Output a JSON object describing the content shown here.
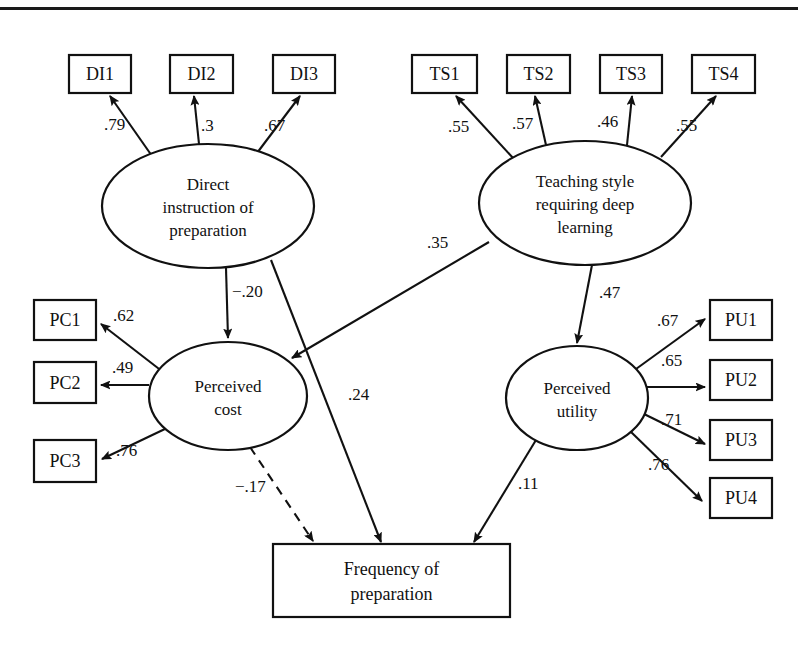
{
  "figure": {
    "type": "sem-path-diagram",
    "top_rule": true
  },
  "latent_variables": [
    {
      "id": "DI",
      "label_lines": [
        "Direct",
        "instruction of",
        "preparation"
      ],
      "cx": 208,
      "cy": 206,
      "rx": 106,
      "ry": 62
    },
    {
      "id": "TS",
      "label_lines": [
        "Teaching style",
        "requiring deep",
        "learning"
      ],
      "cx": 585,
      "cy": 203,
      "rx": 106,
      "ry": 62
    },
    {
      "id": "PC",
      "label_lines": [
        "Perceived",
        "cost"
      ],
      "cx": 228,
      "cy": 396,
      "rx": 79,
      "ry": 54
    },
    {
      "id": "PU",
      "label_lines": [
        "Perceived",
        "utility"
      ],
      "cx": 577,
      "cy": 398,
      "rx": 71,
      "ry": 52
    }
  ],
  "observed_variables": [
    {
      "id": "DI1",
      "label": "DI1",
      "x": 69,
      "y": 55,
      "w": 62,
      "h": 38
    },
    {
      "id": "DI2",
      "label": "DI2",
      "x": 170,
      "y": 55,
      "w": 63,
      "h": 38
    },
    {
      "id": "DI3",
      "label": "DI3",
      "x": 273,
      "y": 55,
      "w": 62,
      "h": 38
    },
    {
      "id": "TS1",
      "label": "TS1",
      "x": 412,
      "y": 55,
      "w": 65,
      "h": 38
    },
    {
      "id": "TS2",
      "label": "TS2",
      "x": 507,
      "y": 55,
      "w": 63,
      "h": 38
    },
    {
      "id": "TS3",
      "label": "TS3",
      "x": 600,
      "y": 55,
      "w": 62,
      "h": 38
    },
    {
      "id": "TS4",
      "label": "TS4",
      "x": 692,
      "y": 55,
      "w": 63,
      "h": 38
    },
    {
      "id": "PC1",
      "label": "PC1",
      "x": 34,
      "y": 300,
      "w": 62,
      "h": 40
    },
    {
      "id": "PC2",
      "label": "PC2",
      "x": 34,
      "y": 362,
      "w": 62,
      "h": 41
    },
    {
      "id": "PC3",
      "label": "PC3",
      "x": 34,
      "y": 440,
      "w": 62,
      "h": 42
    },
    {
      "id": "PU1",
      "label": "PU1",
      "x": 710,
      "y": 300,
      "w": 62,
      "h": 40
    },
    {
      "id": "PU2",
      "label": "PU2",
      "x": 710,
      "y": 360,
      "w": 62,
      "h": 40
    },
    {
      "id": "PU3",
      "label": "PU3",
      "x": 710,
      "y": 420,
      "w": 62,
      "h": 40
    },
    {
      "id": "PU4",
      "label": "PU4",
      "x": 710,
      "y": 478,
      "w": 62,
      "h": 40
    }
  ],
  "outcome": {
    "id": "FP",
    "label_lines": [
      "Frequency of",
      "preparation"
    ],
    "x": 273,
    "y": 544,
    "w": 237,
    "h": 73
  },
  "paths": [
    {
      "id": "DI-DI1",
      "from": "DI",
      "to": "DI1",
      "coefficient": ".79",
      "style": "solid",
      "x1": 152,
      "y1": 156,
      "x2": 110,
      "y2": 96,
      "lx": 104,
      "ly": 130
    },
    {
      "id": "DI-DI2",
      "from": "DI",
      "to": "DI2",
      "coefficient": ".3",
      "style": "solid",
      "x1": 199,
      "y1": 144,
      "x2": 194,
      "y2": 96,
      "lx": 201,
      "ly": 131
    },
    {
      "id": "DI-DI3",
      "from": "DI",
      "to": "DI3",
      "coefficient": ".67",
      "style": "solid",
      "x1": 257,
      "y1": 153,
      "x2": 300,
      "y2": 96,
      "lx": 264,
      "ly": 131
    },
    {
      "id": "TS-TS1",
      "from": "TS",
      "to": "TS1",
      "coefficient": ".55",
      "style": "solid",
      "x1": 513,
      "y1": 158,
      "x2": 456,
      "y2": 96,
      "lx": 448,
      "ly": 132
    },
    {
      "id": "TS-TS2",
      "from": "TS",
      "to": "TS2",
      "coefficient": ".57",
      "style": "solid",
      "x1": 546,
      "y1": 145,
      "x2": 535,
      "y2": 96,
      "lx": 512,
      "ly": 129
    },
    {
      "id": "TS-TS3",
      "from": "TS",
      "to": "TS3",
      "coefficient": ".46",
      "style": "solid",
      "x1": 627,
      "y1": 145,
      "x2": 632,
      "y2": 96,
      "lx": 597,
      "ly": 127
    },
    {
      "id": "TS-TS4",
      "from": "TS",
      "to": "TS4",
      "coefficient": ".55",
      "style": "solid",
      "x1": 661,
      "y1": 157,
      "x2": 716,
      "y2": 96,
      "lx": 676,
      "ly": 131
    },
    {
      "id": "PC-PC1",
      "from": "PC",
      "to": "PC1",
      "coefficient": ".62",
      "style": "solid",
      "x1": 163,
      "y1": 372,
      "x2": 101,
      "y2": 324,
      "lx": 113,
      "ly": 321
    },
    {
      "id": "PC-PC2",
      "from": "PC",
      "to": "PC2",
      "coefficient": ".49",
      "style": "solid",
      "x1": 149,
      "y1": 385,
      "x2": 101,
      "y2": 385,
      "lx": 112,
      "ly": 373
    },
    {
      "id": "PC-PC3",
      "from": "PC",
      "to": "PC3",
      "coefficient": ".76",
      "style": "solid",
      "x1": 167,
      "y1": 428,
      "x2": 102,
      "y2": 459,
      "lx": 116,
      "ly": 456
    },
    {
      "id": "PU-PU1",
      "from": "PU",
      "to": "PU1",
      "coefficient": ".67",
      "style": "solid",
      "x1": 636,
      "y1": 369,
      "x2": 705,
      "y2": 319,
      "lx": 657,
      "ly": 326
    },
    {
      "id": "PU-PU2",
      "from": "PU",
      "to": "PU2",
      "coefficient": ".65",
      "style": "solid",
      "x1": 647,
      "y1": 387,
      "x2": 705,
      "y2": 387,
      "lx": 661,
      "ly": 366
    },
    {
      "id": "PU-PU3",
      "from": "PU",
      "to": "PU3",
      "coefficient": ".71",
      "style": "solid",
      "x1": 644,
      "y1": 414,
      "x2": 705,
      "y2": 444,
      "lx": 661,
      "ly": 425
    },
    {
      "id": "PU-PU4",
      "from": "PU",
      "to": "PU4",
      "coefficient": ".76",
      "style": "solid",
      "x1": 630,
      "y1": 431,
      "x2": 702,
      "y2": 501,
      "lx": 648,
      "ly": 470
    },
    {
      "id": "DI-PC",
      "from": "DI",
      "to": "PC",
      "coefficient": "−.20",
      "style": "solid",
      "x1": 226,
      "y1": 268,
      "x2": 228,
      "y2": 338,
      "lx": 232,
      "ly": 297
    },
    {
      "id": "TS-PC",
      "from": "TS",
      "to": "PC",
      "coefficient": ".35",
      "style": "solid",
      "x1": 489,
      "y1": 242,
      "x2": 292,
      "y2": 358,
      "lx": 427,
      "ly": 248
    },
    {
      "id": "TS-PU",
      "from": "TS",
      "to": "PU",
      "coefficient": ".47",
      "style": "solid",
      "x1": 592,
      "y1": 265,
      "x2": 577,
      "y2": 343,
      "lx": 599,
      "ly": 298
    },
    {
      "id": "DI-FP",
      "from": "DI",
      "to": "FP",
      "coefficient": ".24",
      "style": "solid",
      "x1": 271,
      "y1": 260,
      "x2": 381,
      "y2": 542,
      "lx": 348,
      "ly": 400
    },
    {
      "id": "PC-FP",
      "from": "PC",
      "to": "FP",
      "coefficient": "−.17",
      "style": "dashed",
      "x1": 250,
      "y1": 447,
      "x2": 313,
      "y2": 541,
      "lx": 235,
      "ly": 492
    },
    {
      "id": "PU-FP",
      "from": "PU",
      "to": "FP",
      "coefficient": ".11",
      "style": "solid",
      "x1": 536,
      "y1": 440,
      "x2": 474,
      "y2": 542,
      "lx": 518,
      "ly": 489
    }
  ],
  "colors": {
    "stroke": "#111111",
    "fill": "#ffffff",
    "rule": "#1a1a1a"
  }
}
